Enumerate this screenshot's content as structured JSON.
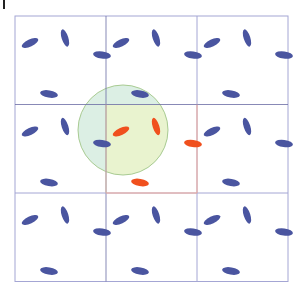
{
  "diagram": {
    "grid": {
      "origin": [
        15,
        16
      ],
      "cell_width": 91,
      "cell_height": 88.5,
      "rows": 3,
      "cols": 3,
      "line_color": "#a4a6d4",
      "dark_line_color": "#6a6ca4",
      "center_cell_border_color": "#f0a898"
    },
    "molecule_template": [
      {
        "dx": 15,
        "dy": 27,
        "rx": 9,
        "ry": 3.5,
        "angle": -25
      },
      {
        "dx": 50,
        "dy": 22,
        "rx": 9,
        "ry": 3.3,
        "angle": 72
      },
      {
        "dx": 87,
        "dy": 39,
        "rx": 9,
        "ry": 3.6,
        "angle": 8
      },
      {
        "dx": 34,
        "dy": 78,
        "rx": 9,
        "ry": 3.6,
        "angle": 10
      }
    ],
    "colors": {
      "image_molecule": "#4a55a0",
      "central_molecule": "#f0501e",
      "cutoff_fill": "#e9f3cf",
      "cutoff_fill_outside": "#dcefe4",
      "cutoff_stroke": "#a9cb92"
    },
    "cutoff_circle": {
      "cx": 123,
      "cy": 130,
      "r": 45
    },
    "center_cell": {
      "row": 1,
      "col": 1
    }
  }
}
